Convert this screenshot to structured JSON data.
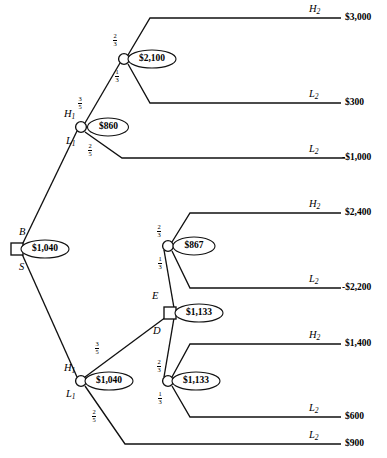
{
  "diagram": {
    "type": "decision-tree"
  },
  "nodes": {
    "root": {
      "id": "root",
      "shape": "square",
      "value": "$1,040"
    },
    "upper_chance_1": {
      "id": "H1-upper",
      "shape": "circle",
      "value": "$860"
    },
    "upper_chance_2": {
      "id": "chance-2100",
      "shape": "circle",
      "value": "$2,100"
    },
    "lower_chance_1": {
      "id": "H1-lower",
      "shape": "circle",
      "value": "$1,040"
    },
    "decision_ed": {
      "id": "decision-ED",
      "shape": "square",
      "value": "$1,133"
    },
    "chance_867": {
      "id": "chance-867",
      "shape": "circle",
      "value": "$867"
    },
    "chance_1133": {
      "id": "chance-1133",
      "shape": "circle",
      "value": "$1,133"
    }
  },
  "branch_labels": {
    "root_up": "B",
    "root_down": "S",
    "upper_h1": "H",
    "upper_h1_sub": "1",
    "upper_l1": "L",
    "upper_l1_sub": "1",
    "lower_h1": "H",
    "lower_h1_sub": "1",
    "lower_l1": "L",
    "lower_l1_sub": "1",
    "decision_up": "E",
    "decision_down": "D"
  },
  "probabilities": {
    "upper_h1": {
      "num": "3",
      "den": "5"
    },
    "upper_l1": {
      "num": "2",
      "den": "5"
    },
    "upper_chance2_h2": {
      "num": "2",
      "den": "3"
    },
    "upper_chance2_l2": {
      "num": "1",
      "den": "3"
    },
    "lower_h1": {
      "num": "3",
      "den": "5"
    },
    "lower_l1": {
      "num": "2",
      "den": "5"
    },
    "chance867_h2": {
      "num": "2",
      "den": "3"
    },
    "chance867_l2": {
      "num": "1",
      "den": "3"
    },
    "chance1133_h2": {
      "num": "2",
      "den": "3"
    },
    "chance1133_l2": {
      "num": "1",
      "den": "3"
    }
  },
  "outcomes": [
    {
      "label": "H",
      "sub": "2",
      "payoff": "$3,000"
    },
    {
      "label": "L",
      "sub": "2",
      "payoff": "$300"
    },
    {
      "label": "L",
      "sub": "2",
      "payoff": "-$1,000"
    },
    {
      "label": "H",
      "sub": "2",
      "payoff": "$2,400"
    },
    {
      "label": "L",
      "sub": "2",
      "payoff": "-$2,200"
    },
    {
      "label": "H",
      "sub": "2",
      "payoff": "$1,400"
    },
    {
      "label": "L",
      "sub": "2",
      "payoff": "$600"
    },
    {
      "label": "L",
      "sub": "2",
      "payoff": "$900"
    }
  ],
  "colors": {
    "stroke": "#111111",
    "background": "#ffffff",
    "text": "#000000"
  }
}
